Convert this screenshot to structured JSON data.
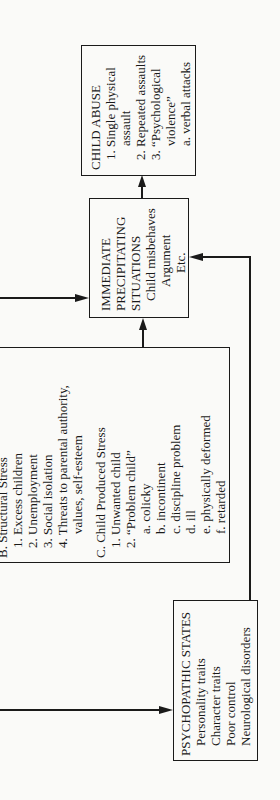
{
  "child_abuse": {
    "title": "CHILD ABUSE",
    "items": [
      "1.  Single  physical",
      "assault",
      "2.  Repeated  assaults",
      "3.  “Psychological",
      "violence”",
      "a.  verbal  attacks"
    ]
  },
  "immediate": {
    "lines": [
      "IMMEDIATE",
      "PRECIPITATING",
      "SITUATIONS",
      "Child  misbehaves",
      "Argument",
      "Etc."
    ]
  },
  "stress": {
    "section_b_title": "B.  Structural Stress",
    "section_b_items": [
      "1.  Excess children",
      "2.  Unemployment",
      "3.  Social isolation",
      "4.  Threats to parental authority,",
      "values, self-esteem"
    ],
    "section_c_title": "C.  Child Produced Stress",
    "section_c_items": [
      "1.  Unwanted child",
      "2.  “Problem child”",
      "a.  colicky",
      "b.  incontinent",
      "c.  discipline problem",
      "d.  ill",
      "e.  physically deformed",
      "f.  retarded"
    ]
  },
  "psychopathic": {
    "title": "PSYCHOPATHIC  STATES",
    "items": [
      "Personality  traits",
      "Character  traits",
      "Poor  control",
      "Neurological  disorders"
    ]
  }
}
